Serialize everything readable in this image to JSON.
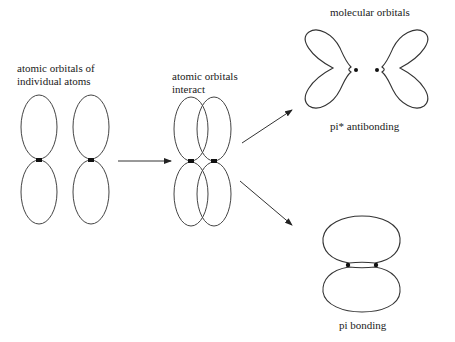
{
  "diagram": {
    "stages": [
      {
        "id": "atomic",
        "label_line1": "atomic orbitals of",
        "label_line2": "individual atoms"
      },
      {
        "id": "interact",
        "label_line1": "atomic orbitals",
        "label_line2": "interact"
      },
      {
        "id": "molecular",
        "label": "molecular orbitals"
      }
    ],
    "results": {
      "antibonding_label": "pi* antibonding",
      "bonding_label": "pi bonding"
    },
    "colors": {
      "stroke": "#333333",
      "dot": "#111111",
      "background": "#ffffff"
    }
  }
}
